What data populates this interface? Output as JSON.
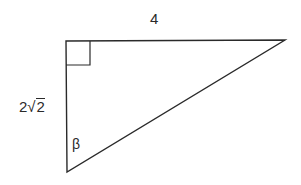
{
  "diagram": {
    "type": "right-triangle",
    "colors": {
      "stroke": "#2a2a2a",
      "background": "#ffffff"
    },
    "vertices": {
      "right_angle": {
        "x": 66,
        "y": 41
      },
      "top_right": {
        "x": 285,
        "y": 40
      },
      "bottom": {
        "x": 67,
        "y": 172
      }
    },
    "right_angle_marker_size": 24,
    "labels": {
      "top_side": "4",
      "left_side_coefficient": "2",
      "left_side_radical_symbol": "√",
      "left_side_radicand": "2",
      "angle": "β"
    }
  }
}
